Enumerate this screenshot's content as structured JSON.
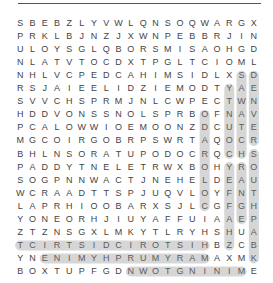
{
  "puzzle": {
    "type": "word-search",
    "rows": 20,
    "cols": 20,
    "grid": [
      "SBEBZLYVWLQNSOQWARGX",
      "PRKLBJNZJXWNPEBBRJIN",
      "ULOYSGLQBORSMISAOHGD",
      "NLATVTOCDXTPGLTCIOML",
      "NHLVCPEDCAHIMSIDLXSD",
      "RSJAIEELIDZIEMODTYAE",
      "SVVCHSPRMJNLCWPECTWN",
      "HDDVONSSNOLSPRBOFNAV",
      "PCALOWWIOEMOONZDCUTE",
      "MGCOIRGOBRPSWRTAQOCR",
      "BHLNSORATUPODOCRQCHS",
      "PADDYTNELETRWXBOHYRO",
      "SOGPNNWACTJNEHELDEAU",
      "WCRAADTTSPJUQVLOYFNT",
      "LAPRHIOOBARXSJLCGFGH",
      "YONEORHJIUYAFFUIAAEP",
      "ZTZNSGXLMKYTLRYHSHUA",
      "TCIRTSIDCIROTSIHBZCBR",
      "YNENIMYHPRUMYRAMAXMK",
      "BOXTUPFGDNWOTGNINIME"
    ],
    "found_words": [
      {
        "word": "HISTORICDISTRICT",
        "start": [
          17,
          15
        ],
        "end": [
          17,
          0
        ]
      },
      {
        "word": "MARYMURPHY",
        "start": [
          18,
          15
        ],
        "end": [
          18,
          2
        ]
      },
      {
        "word": "MININGTOWN",
        "start": [
          19,
          18
        ],
        "end": [
          19,
          9
        ]
      },
      {
        "word": "DENVER",
        "start": [
          4,
          19
        ],
        "end": [
          9,
          19
        ]
      },
      {
        "word": "SOUTHPARK",
        "start": [
          10,
          19
        ],
        "end": [
          18,
          19
        ]
      },
      {
        "word": "SAWATCH",
        "start": [
          4,
          18
        ],
        "end": [
          10,
          18
        ]
      },
      {
        "word": "RANGE",
        "start": [
          11,
          18
        ],
        "end": [
          15,
          18
        ]
      },
      {
        "word": "COUNTY",
        "start": [
          10,
          17
        ],
        "end": [
          5,
          17
        ]
      },
      {
        "word": "CHAFFEE",
        "start": [
          17,
          17
        ],
        "end": [
          11,
          17
        ]
      },
      {
        "word": "ORDCOLD",
        "start": [
          7,
          15
        ],
        "end": [
          14,
          15
        ]
      }
    ]
  },
  "colors": {
    "letter": "#444444",
    "highlight_stroke": "#8a8a8a",
    "background": "#ffffff"
  }
}
